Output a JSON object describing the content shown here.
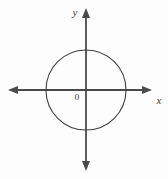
{
  "figure": {
    "kind": "coordinate-plane-with-circle",
    "background_color": "#fdfdfd",
    "axis_color": "#4a4a4a",
    "curve_color": "#3f3f3f",
    "label_color": "#3b3b3b",
    "width": 168,
    "height": 179
  },
  "labels": {
    "x_axis": "x",
    "y_axis": "y",
    "origin": "0"
  },
  "chart_data": {
    "type": "scatter",
    "title": "",
    "subtitle": "",
    "xlabel": "x",
    "ylabel": "y",
    "grid": false,
    "legend": "none",
    "annotations": [
      "0"
    ],
    "xlim": [
      -2,
      2
    ],
    "ylim": [
      -2,
      2
    ],
    "xticks": [],
    "yticks": [],
    "x_tick_labels": [],
    "y_tick_labels": [],
    "series": [
      {
        "name": "circle",
        "shape": "circle",
        "center_x": 0,
        "center_y": 0,
        "radius": 1,
        "closed": true,
        "fill": "none",
        "stroke": "#3f3f3f"
      }
    ],
    "axes": {
      "x_axis_arrows": "both",
      "y_axis_arrows": "both",
      "origin_label": "0",
      "origin_label_position": "lower-left"
    },
    "geometry_px": {
      "origin_px": [
        86,
        90
      ],
      "circle_radius_px": 40,
      "x_axis_y_px": 90,
      "y_axis_x_px": 86,
      "x_axis_span_px": [
        8,
        152
      ],
      "y_axis_span_px": [
        8,
        171
      ]
    }
  }
}
